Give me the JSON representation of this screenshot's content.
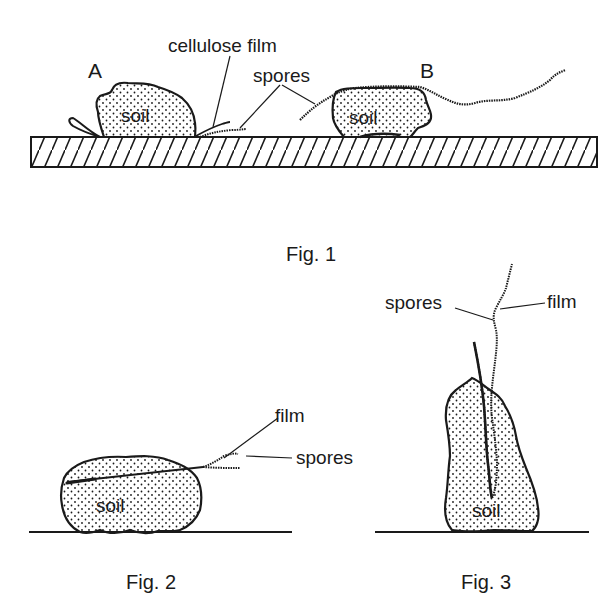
{
  "figures": [
    {
      "id": "fig1",
      "caption": "Fig. 1",
      "labels": {
        "a": "A",
        "b": "B",
        "cellulose_film": "cellulose film",
        "spores": "spores",
        "soil_a": "soil",
        "soil_b": "soil"
      }
    },
    {
      "id": "fig2",
      "caption": "Fig. 2",
      "labels": {
        "film": "film",
        "spores": "spores",
        "soil": "soil"
      }
    },
    {
      "id": "fig3",
      "caption": "Fig. 3",
      "labels": {
        "spores": "spores",
        "film": "film",
        "soil": "soil"
      }
    }
  ],
  "colors": {
    "ink": "#1a1a1a",
    "background": "#ffffff"
  }
}
